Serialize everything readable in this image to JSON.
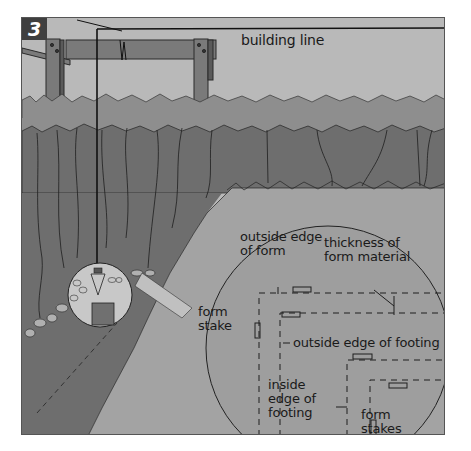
{
  "figure": {
    "step_number": "3",
    "colors": {
      "sky": "#b9b9b9",
      "grass": "#8e8e8e",
      "trench_wall": "#6e6e6e",
      "trench_floor": "#a3a3a3",
      "inset": "#9e9e9e",
      "small_inset": "#c8c8c8",
      "line": "#1a1a1a",
      "badge": "#3f3f3f"
    }
  },
  "labels": {
    "building_line": "building line",
    "outside_edge_of_form": "outside edge\nof form",
    "thickness_of_form_material": "thickness of\nform material",
    "form_stake": "form\nstake",
    "outside_edge_of_footing": "outside edge of footing",
    "inside_edge_of_footing": "inside\nedge of\nfooting",
    "form_stakes": "form\nstakes"
  }
}
